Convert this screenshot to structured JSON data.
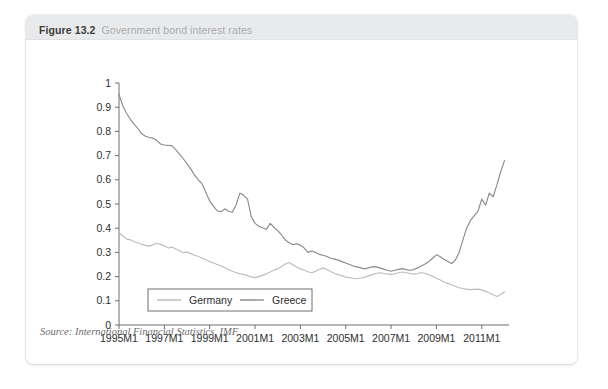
{
  "figure": {
    "number": "Figure 13.2",
    "title": "Government bond interest rates",
    "source": "Source: International Financial Statistics, IMF",
    "source_label": "Source:",
    "source_italic_part": "International Financial Statistics",
    "source_tail": ", IMF"
  },
  "colors": {
    "card_background": "#ffffff",
    "header_band": "#e9eaec",
    "number_text": "#3c3c3c",
    "title_text": "#a8abad",
    "axis": "#6f6f6f",
    "germany_line": "#bdbdbd",
    "greece_line": "#8a8a8a",
    "legend_border": "#6f6f6f",
    "source_text": "#6d6d6d"
  },
  "chart_data": {
    "type": "line",
    "title": "Government bond interest rates",
    "xlabel": "",
    "ylabel": "",
    "ylim": [
      0,
      1
    ],
    "ytick_values": [
      0,
      0.1,
      0.2,
      0.3,
      0.4,
      0.5,
      0.6,
      0.7,
      0.8,
      0.9,
      1
    ],
    "ytick_labels": [
      "0",
      "0.1",
      "0.2",
      "0.3",
      "0.4",
      "0.5",
      "0.6",
      "0.7",
      "0.8",
      "0.9",
      "1"
    ],
    "xtick_labels": [
      "1995M1",
      "1997M1",
      "1999M1",
      "2001M1",
      "2003M1",
      "2005M1",
      "2007M1",
      "2009M1",
      "2011M1"
    ],
    "xtick_values": [
      1995,
      1997,
      1999,
      2001,
      2003,
      2005,
      2007,
      2009,
      2011
    ],
    "xlim": [
      1995,
      2012.2
    ],
    "grid": false,
    "legend_position": "bottom-left",
    "legend_entries": [
      "Germany",
      "Greece"
    ],
    "series": [
      {
        "name": "Germany",
        "color": "#bdbdbd",
        "x": [
          1995.0,
          1995.17,
          1995.33,
          1995.5,
          1995.67,
          1995.83,
          1996.0,
          1996.17,
          1996.33,
          1996.5,
          1996.67,
          1996.83,
          1997.0,
          1997.17,
          1997.33,
          1997.5,
          1997.67,
          1997.83,
          1998.0,
          1998.17,
          1998.33,
          1998.5,
          1998.67,
          1998.83,
          1999.0,
          1999.17,
          1999.33,
          1999.5,
          1999.67,
          1999.83,
          2000.0,
          2000.17,
          2000.33,
          2000.5,
          2000.67,
          2000.83,
          2001.0,
          2001.17,
          2001.33,
          2001.5,
          2001.67,
          2001.83,
          2002.0,
          2002.17,
          2002.33,
          2002.5,
          2002.67,
          2002.83,
          2003.0,
          2003.17,
          2003.33,
          2003.5,
          2003.67,
          2003.83,
          2004.0,
          2004.17,
          2004.33,
          2004.5,
          2004.67,
          2004.83,
          2005.0,
          2005.17,
          2005.33,
          2005.5,
          2005.67,
          2005.83,
          2006.0,
          2006.17,
          2006.33,
          2006.5,
          2006.67,
          2006.83,
          2007.0,
          2007.17,
          2007.33,
          2007.5,
          2007.67,
          2007.83,
          2008.0,
          2008.17,
          2008.33,
          2008.5,
          2008.67,
          2008.83,
          2009.0,
          2009.17,
          2009.33,
          2009.5,
          2009.67,
          2009.83,
          2010.0,
          2010.17,
          2010.33,
          2010.5,
          2010.67,
          2010.83,
          2011.0,
          2011.17,
          2011.33,
          2011.5,
          2011.67,
          2011.83,
          2012.0
        ],
        "y": [
          0.381,
          0.368,
          0.356,
          0.352,
          0.344,
          0.34,
          0.333,
          0.329,
          0.326,
          0.331,
          0.338,
          0.333,
          0.327,
          0.318,
          0.322,
          0.314,
          0.307,
          0.299,
          0.301,
          0.295,
          0.288,
          0.283,
          0.276,
          0.27,
          0.262,
          0.256,
          0.25,
          0.244,
          0.237,
          0.229,
          0.222,
          0.216,
          0.212,
          0.208,
          0.204,
          0.199,
          0.196,
          0.2,
          0.205,
          0.212,
          0.219,
          0.226,
          0.233,
          0.241,
          0.252,
          0.258,
          0.249,
          0.24,
          0.232,
          0.226,
          0.22,
          0.216,
          0.222,
          0.229,
          0.236,
          0.229,
          0.221,
          0.214,
          0.208,
          0.203,
          0.198,
          0.196,
          0.193,
          0.191,
          0.194,
          0.198,
          0.203,
          0.208,
          0.213,
          0.216,
          0.214,
          0.211,
          0.209,
          0.212,
          0.216,
          0.219,
          0.216,
          0.213,
          0.21,
          0.213,
          0.217,
          0.213,
          0.208,
          0.201,
          0.193,
          0.186,
          0.178,
          0.172,
          0.166,
          0.16,
          0.154,
          0.151,
          0.148,
          0.146,
          0.147,
          0.148,
          0.145,
          0.139,
          0.132,
          0.125,
          0.118,
          0.126,
          0.136
        ]
      },
      {
        "name": "Greece",
        "color": "#8a8a8a",
        "x": [
          1995.0,
          1995.17,
          1995.33,
          1995.5,
          1995.67,
          1995.83,
          1996.0,
          1996.17,
          1996.33,
          1996.5,
          1996.67,
          1996.83,
          1997.0,
          1997.17,
          1997.33,
          1997.5,
          1997.67,
          1997.83,
          1998.0,
          1998.17,
          1998.33,
          1998.5,
          1998.67,
          1998.83,
          1999.0,
          1999.17,
          1999.33,
          1999.5,
          1999.67,
          1999.83,
          2000.0,
          2000.17,
          2000.33,
          2000.5,
          2000.67,
          2000.83,
          2001.0,
          2001.17,
          2001.33,
          2001.5,
          2001.67,
          2001.83,
          2002.0,
          2002.17,
          2002.33,
          2002.5,
          2002.67,
          2002.83,
          2003.0,
          2003.17,
          2003.33,
          2003.5,
          2003.67,
          2003.83,
          2004.0,
          2004.17,
          2004.33,
          2004.5,
          2004.67,
          2004.83,
          2005.0,
          2005.17,
          2005.33,
          2005.5,
          2005.67,
          2005.83,
          2006.0,
          2006.17,
          2006.33,
          2006.5,
          2006.67,
          2006.83,
          2007.0,
          2007.17,
          2007.33,
          2007.5,
          2007.67,
          2007.83,
          2008.0,
          2008.17,
          2008.33,
          2008.5,
          2008.67,
          2008.83,
          2009.0,
          2009.17,
          2009.33,
          2009.5,
          2009.67,
          2009.83,
          2010.0,
          2010.17,
          2010.33,
          2010.5,
          2010.67,
          2010.83,
          2011.0,
          2011.17,
          2011.33,
          2011.5,
          2011.67,
          2011.83,
          2012.0
        ],
        "y": [
          0.953,
          0.905,
          0.875,
          0.85,
          0.83,
          0.812,
          0.79,
          0.78,
          0.775,
          0.772,
          0.762,
          0.748,
          0.744,
          0.742,
          0.741,
          0.725,
          0.706,
          0.688,
          0.666,
          0.644,
          0.62,
          0.6,
          0.582,
          0.548,
          0.512,
          0.49,
          0.472,
          0.468,
          0.48,
          0.47,
          0.466,
          0.498,
          0.545,
          0.536,
          0.52,
          0.448,
          0.42,
          0.408,
          0.402,
          0.396,
          0.42,
          0.404,
          0.39,
          0.372,
          0.352,
          0.34,
          0.332,
          0.336,
          0.33,
          0.318,
          0.3,
          0.306,
          0.3,
          0.292,
          0.288,
          0.283,
          0.276,
          0.272,
          0.268,
          0.262,
          0.256,
          0.25,
          0.244,
          0.24,
          0.236,
          0.232,
          0.236,
          0.241,
          0.24,
          0.236,
          0.231,
          0.226,
          0.222,
          0.226,
          0.23,
          0.233,
          0.229,
          0.226,
          0.229,
          0.236,
          0.244,
          0.252,
          0.262,
          0.276,
          0.29,
          0.282,
          0.272,
          0.262,
          0.254,
          0.268,
          0.3,
          0.352,
          0.4,
          0.432,
          0.452,
          0.47,
          0.52,
          0.495,
          0.545,
          0.53,
          0.58,
          0.632,
          0.68
        ]
      }
    ]
  }
}
